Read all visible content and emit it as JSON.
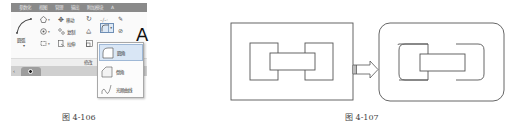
{
  "figure_left": {
    "caption": "图 4-106",
    "ribbon": {
      "tabs": [
        "参数化",
        "视图",
        "管理",
        "输出",
        "附加模块",
        "A"
      ],
      "arc_tool": {
        "label": "圆弧",
        "icon": "arc-icon"
      },
      "modify_tools": [
        {
          "label": "移动",
          "icon": "move-icon"
        },
        {
          "label": "复制",
          "icon": "copy-icon"
        },
        {
          "label": "拉伸",
          "icon": "stretch-icon"
        }
      ],
      "draw_tools": [
        {
          "icon": "polygon-icon"
        },
        {
          "icon": "hatch-icon"
        },
        {
          "icon": "boundary-icon"
        }
      ],
      "panel_footer_label": "修改",
      "panel_footer_label_right": "注",
      "text_tool_glyph": "A",
      "fillet_split_button": {
        "icon": "fillet-icon",
        "dropdown_caret": "▾"
      },
      "dropdown_items": [
        {
          "label": "圆角",
          "icon": "fillet-icon",
          "active": true
        },
        {
          "label": "倒角",
          "icon": "chamfer-icon",
          "active": false
        },
        {
          "label": "光顺曲线",
          "icon": "blend-curve-icon",
          "active": false
        }
      ]
    }
  },
  "figure_right": {
    "caption": "图 4-107",
    "before": "rectangular frame with sharp-corner nested blocks",
    "after": "rounded frame with filleted nested blocks",
    "arrow": "right-arrow"
  }
}
